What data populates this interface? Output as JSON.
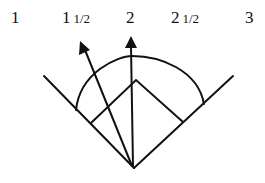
{
  "labels": [
    {
      "main": "1",
      "frac": "",
      "x": 11
    },
    {
      "main": "1",
      "frac": "1/2",
      "x": 62
    },
    {
      "main": "2",
      "frac": "",
      "x": 126
    },
    {
      "main": "2",
      "frac": "1/2",
      "x": 171
    },
    {
      "main": "3",
      "frac": "",
      "x": 245
    }
  ],
  "diagram": {
    "stroke_color": "#111111"
  }
}
